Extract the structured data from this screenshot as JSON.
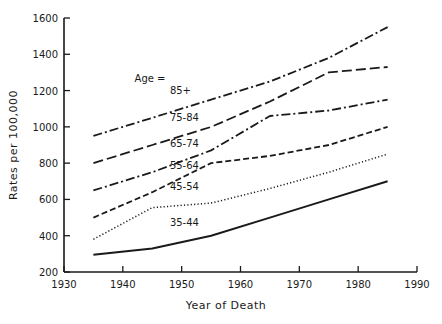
{
  "chart_data": {
    "type": "line",
    "title": "",
    "xlabel": "Year of Death",
    "ylabel": "Rates per 100,000",
    "xlim": [
      1930,
      1990
    ],
    "ylim": [
      200,
      1600
    ],
    "xticks": [
      1930,
      1940,
      1950,
      1960,
      1970,
      1980,
      1990
    ],
    "yticks": [
      200,
      400,
      600,
      800,
      1000,
      1200,
      1400,
      1600
    ],
    "grid": false,
    "legend": {
      "type": "inline-labels",
      "header": "Age ="
    },
    "series": [
      {
        "name": "85+",
        "style": "dash-dot",
        "x": [
          1935,
          1945,
          1955,
          1965,
          1975,
          1985
        ],
        "values": [
          950,
          1050,
          1150,
          1250,
          1380,
          1550
        ]
      },
      {
        "name": "75-84",
        "style": "long-dash",
        "x": [
          1935,
          1945,
          1955,
          1965,
          1975,
          1985
        ],
        "values": [
          800,
          900,
          1000,
          1140,
          1300,
          1330
        ]
      },
      {
        "name": "65-74",
        "style": "dash-dot",
        "x": [
          1935,
          1945,
          1955,
          1965,
          1975,
          1985
        ],
        "values": [
          650,
          750,
          870,
          1060,
          1090,
          1150
        ]
      },
      {
        "name": "55-64",
        "style": "dashed",
        "x": [
          1935,
          1945,
          1955,
          1965,
          1975,
          1985
        ],
        "values": [
          500,
          640,
          800,
          840,
          900,
          1000
        ]
      },
      {
        "name": "45-54",
        "style": "dotted",
        "x": [
          1935,
          1945,
          1955,
          1965,
          1975,
          1985
        ],
        "values": [
          380,
          555,
          580,
          660,
          750,
          850
        ]
      },
      {
        "name": "35-44",
        "style": "solid",
        "x": [
          1935,
          1945,
          1955,
          1965,
          1975,
          1985
        ],
        "values": [
          295,
          330,
          400,
          500,
          600,
          700
        ]
      }
    ],
    "annotations": [
      {
        "text": "Age =",
        "x": 1942,
        "y": 1250
      },
      {
        "text": "85+",
        "x": 1948,
        "y": 1180
      },
      {
        "text": "75-84",
        "x": 1948,
        "y": 1035
      },
      {
        "text": "65-74",
        "x": 1948,
        "y": 890
      },
      {
        "text": "55-64",
        "x": 1948,
        "y": 770
      },
      {
        "text": "45-54",
        "x": 1948,
        "y": 650
      },
      {
        "text": "35-44",
        "x": 1948,
        "y": 455
      }
    ]
  },
  "colors": {
    "line": "#1a1a1a",
    "background": "#ffffff"
  }
}
